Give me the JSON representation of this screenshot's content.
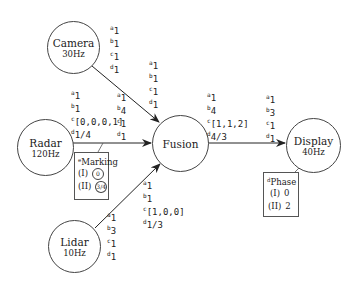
{
  "nodes": {
    "camera": {
      "name": "Camera",
      "rate": "30Hz"
    },
    "radar": {
      "name": "Radar",
      "rate": "120Hz"
    },
    "lidar": {
      "name": "Lidar",
      "rate": "10Hz"
    },
    "fusion": {
      "name": "Fusion",
      "rate": ""
    },
    "display": {
      "name": "Display",
      "rate": "40Hz"
    }
  },
  "edges": {
    "camera_out": {
      "a": "1",
      "b": "1",
      "c": "1",
      "d": "1"
    },
    "camera_in_fusion": {
      "a": "1",
      "b": "1",
      "c": "1",
      "d": "1"
    },
    "radar_out": {
      "a": "1",
      "b": "1",
      "c": "[0,0,0,1]",
      "d": "1/4"
    },
    "radar_in_fusion": {
      "a": "1",
      "b": "4",
      "c": "1",
      "d": "1"
    },
    "lidar_out": {
      "a": "1",
      "b": "3",
      "c": "1",
      "d": "1"
    },
    "lidar_in_fusion": {
      "a": "1",
      "b": "1",
      "c": "[1,0,0]",
      "d": "1/3"
    },
    "fusion_out": {
      "a": "1",
      "b": "4",
      "c": "[1,1,2]",
      "d": "4/3"
    },
    "display_in": {
      "a": "1",
      "b": "3",
      "c": "1",
      "d": "1"
    }
  },
  "superscripts": {
    "a": "a",
    "b": "b",
    "c": "c",
    "d": "d",
    "e": "e"
  },
  "marking": {
    "title": "Marking",
    "title_sup": "e",
    "rows": [
      {
        "label": "(I)",
        "value": "0"
      },
      {
        "label": "(II)",
        "value": "3/4"
      }
    ]
  },
  "phase": {
    "title": "Phase",
    "title_sup": "d",
    "rows": [
      {
        "label": "(I)",
        "value": "0"
      },
      {
        "label": "(II)",
        "value": "2"
      }
    ]
  }
}
